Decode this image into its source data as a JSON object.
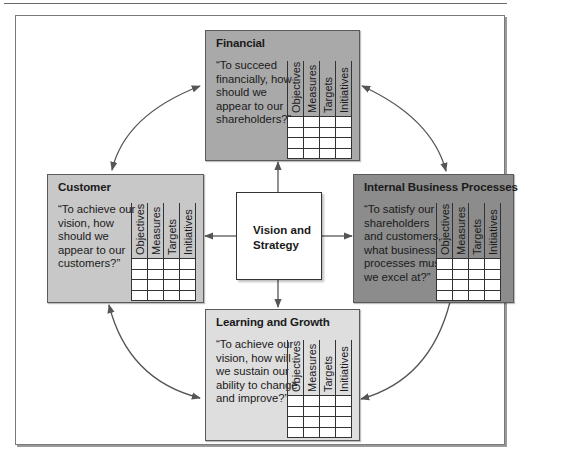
{
  "diagram": {
    "type": "balanced-scorecard",
    "center": {
      "label": "Vision and Strategy"
    },
    "column_headers": [
      "Objectives",
      "Measures",
      "Targets",
      "Initiatives"
    ],
    "row_count": 4,
    "perspectives": [
      {
        "id": "financial",
        "title": "Financial",
        "question": "“To succeed financially, how should we appear to our shareholders?”",
        "fill": "#a9a9a9"
      },
      {
        "id": "customer",
        "title": "Customer",
        "question": "“To achieve our vision, how should we appear to our customers?”",
        "fill": "#c8c8c8"
      },
      {
        "id": "internal",
        "title": "Internal Business Processes",
        "question": "“To satisfy our shareholders and customers, what business processes must we excel at?”",
        "fill": "#8c8c8c"
      },
      {
        "id": "learning",
        "title": "Learning and Growth",
        "question": "“To achieve our vision, how will we sustain our ability to change and improve?”",
        "fill": "#dedede"
      }
    ],
    "connections": [
      {
        "from": "center",
        "to": "financial",
        "kind": "straight-arrow"
      },
      {
        "from": "center",
        "to": "customer",
        "kind": "straight-arrow"
      },
      {
        "from": "center",
        "to": "internal",
        "kind": "straight-arrow"
      },
      {
        "from": "center",
        "to": "learning",
        "kind": "straight-arrow"
      },
      {
        "from": "financial",
        "to": "customer",
        "kind": "curved-double-arrow"
      },
      {
        "from": "financial",
        "to": "internal",
        "kind": "curved-double-arrow"
      },
      {
        "from": "customer",
        "to": "learning",
        "kind": "curved-double-arrow"
      },
      {
        "from": "internal",
        "to": "learning",
        "kind": "curved-arrow"
      }
    ],
    "colors": {
      "arrow": "#555555",
      "grid_line": "#333333",
      "frame": "#7a7a7a"
    }
  }
}
